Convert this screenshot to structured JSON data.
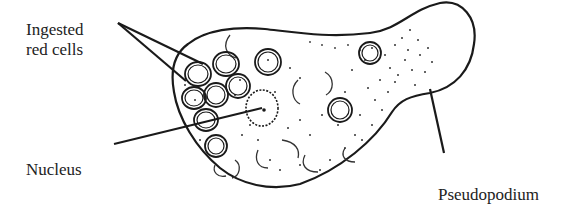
{
  "diagram": {
    "labels": {
      "ingested_line1": "Ingested",
      "ingested_line2": "red cells",
      "nucleus": "Nucleus",
      "pseudopodium": "Pseudopodium"
    },
    "colors": {
      "stroke": "#1a1a1a",
      "background": "#ffffff",
      "text": "#222222"
    }
  }
}
